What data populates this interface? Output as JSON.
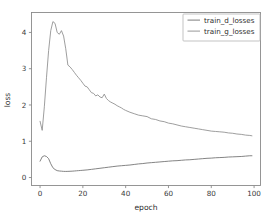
{
  "chart_data": {
    "type": "line",
    "title": "",
    "xlabel": "epoch",
    "ylabel": "loss",
    "xlim": [
      -4,
      103
    ],
    "ylim": [
      -0.22,
      4.55
    ],
    "xticks": [
      "0",
      "20",
      "40",
      "60",
      "80",
      "100"
    ],
    "xtick_values": [
      0,
      20,
      40,
      60,
      80,
      100
    ],
    "yticks": [
      "0",
      "1",
      "2",
      "3",
      "4"
    ],
    "ytick_values": [
      0,
      1,
      2,
      3,
      4
    ],
    "grid": false,
    "legend_position": "upper right",
    "colors": {
      "train_d_losses": "#6e6e6e",
      "train_g_losses": "#8c8c8c",
      "spine": "#8a8a8a",
      "text": "#2e2e2e",
      "background": "#ffffff"
    },
    "series": [
      {
        "name": "train_d_losses",
        "color": "#6e6e6e",
        "x": [
          0,
          1,
          2,
          3,
          4,
          5,
          6,
          7,
          8,
          9,
          10,
          11,
          12,
          13,
          14,
          15,
          16,
          17,
          18,
          19,
          20,
          22,
          24,
          26,
          28,
          30,
          32,
          34,
          36,
          38,
          40,
          42,
          44,
          46,
          48,
          50,
          52,
          54,
          56,
          58,
          60,
          62,
          64,
          66,
          68,
          70,
          72,
          74,
          76,
          78,
          80,
          82,
          84,
          86,
          88,
          90,
          92,
          94,
          96,
          98,
          99
        ],
        "values": [
          0.45,
          0.57,
          0.6,
          0.58,
          0.52,
          0.38,
          0.27,
          0.22,
          0.19,
          0.18,
          0.175,
          0.17,
          0.168,
          0.17,
          0.172,
          0.175,
          0.18,
          0.185,
          0.19,
          0.195,
          0.2,
          0.21,
          0.225,
          0.24,
          0.255,
          0.27,
          0.285,
          0.3,
          0.315,
          0.325,
          0.335,
          0.345,
          0.36,
          0.375,
          0.385,
          0.4,
          0.41,
          0.42,
          0.43,
          0.44,
          0.45,
          0.46,
          0.465,
          0.475,
          0.485,
          0.49,
          0.5,
          0.51,
          0.52,
          0.53,
          0.535,
          0.545,
          0.55,
          0.555,
          0.565,
          0.57,
          0.575,
          0.58,
          0.59,
          0.6,
          0.6
        ]
      },
      {
        "name": "train_g_losses",
        "color": "#8c8c8c",
        "x": [
          0,
          1,
          2,
          3,
          4,
          5,
          6,
          7,
          8,
          9,
          10,
          11,
          12,
          13,
          14,
          15,
          16,
          17,
          18,
          19,
          20,
          21,
          22,
          23,
          24,
          25,
          26,
          27,
          28,
          29,
          30,
          31,
          32,
          33,
          34,
          35,
          36,
          37,
          38,
          39,
          40,
          42,
          44,
          46,
          48,
          50,
          52,
          54,
          56,
          58,
          60,
          62,
          64,
          66,
          68,
          70,
          72,
          74,
          76,
          78,
          80,
          82,
          84,
          86,
          88,
          90,
          92,
          94,
          96,
          98,
          99
        ],
        "values": [
          1.55,
          1.3,
          1.95,
          2.75,
          3.5,
          4.05,
          4.3,
          4.25,
          4.0,
          3.95,
          4.05,
          3.9,
          3.55,
          3.1,
          3.05,
          2.98,
          2.9,
          2.82,
          2.75,
          2.68,
          2.6,
          2.52,
          2.5,
          2.42,
          2.34,
          2.32,
          2.25,
          2.28,
          2.22,
          2.2,
          2.3,
          2.18,
          2.12,
          2.08,
          2.05,
          2.02,
          1.98,
          1.95,
          1.92,
          1.88,
          1.85,
          1.8,
          1.76,
          1.72,
          1.7,
          1.68,
          1.62,
          1.6,
          1.56,
          1.54,
          1.5,
          1.48,
          1.45,
          1.42,
          1.4,
          1.38,
          1.36,
          1.34,
          1.32,
          1.3,
          1.28,
          1.27,
          1.26,
          1.25,
          1.23,
          1.22,
          1.2,
          1.19,
          1.17,
          1.16,
          1.15
        ]
      }
    ],
    "legend_entries": [
      {
        "label": "train_d_losses",
        "color": "#6e6e6e"
      },
      {
        "label": "train_g_losses",
        "color": "#8c8c8c"
      }
    ]
  }
}
